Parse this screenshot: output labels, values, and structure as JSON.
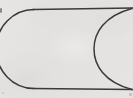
{
  "figure": {
    "kind": "line-drawing",
    "medium": "scanned pencil line art",
    "canvas": {
      "width": 133,
      "height": 98
    },
    "colors": {
      "background": "#f2f1f0",
      "stroke": "#3a3a3a",
      "stroke_light": "#5e5e5e",
      "speck": "#5b5b5b"
    },
    "stroke": {
      "width": 1.5,
      "linecap": "round",
      "fill": "none"
    },
    "strokes": [
      {
        "name": "left-round-cap-arc",
        "description": "Semicircular arc forming the rounded left end of the capsule, opening to the right",
        "path": "M 34 9.5 A 38 39.5 0 0 0 34 88.5",
        "leftmost_x": 10,
        "top_y": 9.5,
        "bottom_y": 88.5
      },
      {
        "name": "top-edge-line",
        "description": "Horizontal top edge running from the left cap to the right image edge",
        "path": "M 33 9.5 L 133 8",
        "y": 9.5
      },
      {
        "name": "bottom-edge-line",
        "description": "Horizontal bottom edge running from the left cap to the right image edge",
        "path": "M 33 88.5 L 133 89.5",
        "y": 88.5
      },
      {
        "name": "inner-crescent-arc",
        "description": "Arc bulging leftward at mid-height, meeting the top and bottom edges at the right border",
        "path": "M 132 8.5 C 104 16 94 33 94 49 C 94 65 104 82 132 89.5",
        "apex_x": 94,
        "apex_y": 49
      }
    ],
    "artifacts": [
      {
        "name": "edge-speck",
        "description": "Small dark speck at the far left border",
        "x": 0,
        "y": 8
      },
      {
        "name": "corner-speck-br",
        "description": "Faint smudge near the bottom right corner",
        "x": 129,
        "y": 93
      },
      {
        "name": "corner-speck-bl",
        "description": "Faint smudge near the bottom left corner",
        "x": 2,
        "y": 92
      }
    ]
  }
}
